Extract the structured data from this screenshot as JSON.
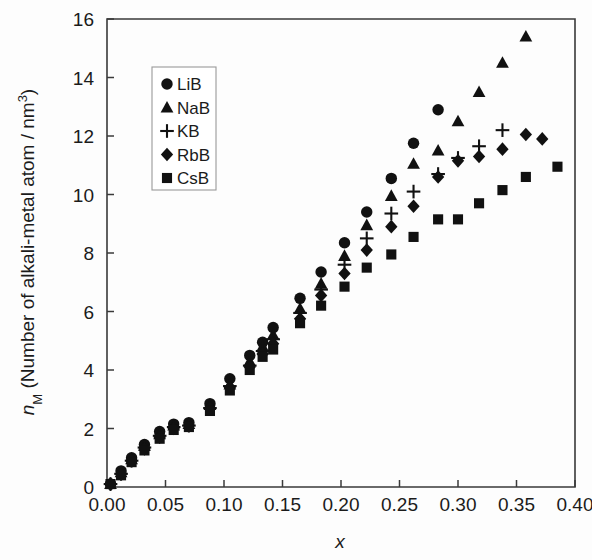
{
  "figure": {
    "name": "alkali-metal-atom-density-vs-x",
    "background": "#fdfdfd",
    "marker_color": "#111111",
    "axis_color": "#3a3a3a"
  },
  "chart_data": {
    "type": "scatter",
    "title": "",
    "subtitle": "",
    "xlabel": "x",
    "ylabel_main": "n",
    "ylabel_sub": "M",
    "ylabel_rest": " (Number of alkali-metal atom / nm",
    "ylabel_sup": "3",
    "ylabel_close": ")",
    "ylabel_plain": "nM (Number of alkali-metal atom / nm3)",
    "xlim": [
      0.0,
      0.4
    ],
    "ylim": [
      0,
      16
    ],
    "xticks": [
      0.0,
      0.05,
      0.1,
      0.15,
      0.2,
      0.25,
      0.3,
      0.35,
      0.4
    ],
    "xtick_labels": [
      "0.00",
      "0.05",
      "0.10",
      "0.15",
      "0.20",
      "0.25",
      "0.30",
      "0.35",
      "0.40"
    ],
    "yticks": [
      0,
      2,
      4,
      6,
      8,
      10,
      12,
      14,
      16
    ],
    "ytick_labels": [
      "0",
      "2",
      "4",
      "6",
      "8",
      "10",
      "12",
      "14",
      "16"
    ],
    "grid": false,
    "legend_position": "upper-left-inside",
    "series": [
      {
        "name": "LiB",
        "marker": "circle",
        "points": [
          [
            0.003,
            0.1
          ],
          [
            0.012,
            0.55
          ],
          [
            0.021,
            1.0
          ],
          [
            0.032,
            1.45
          ],
          [
            0.045,
            1.9
          ],
          [
            0.057,
            2.15
          ],
          [
            0.07,
            2.2
          ],
          [
            0.088,
            2.85
          ],
          [
            0.105,
            3.7
          ],
          [
            0.122,
            4.5
          ],
          [
            0.133,
            4.95
          ],
          [
            0.142,
            5.45
          ],
          [
            0.165,
            6.45
          ],
          [
            0.183,
            7.35
          ],
          [
            0.203,
            8.35
          ],
          [
            0.222,
            9.4
          ],
          [
            0.243,
            10.55
          ],
          [
            0.262,
            11.75
          ],
          [
            0.283,
            12.9
          ]
        ]
      },
      {
        "name": "NaB",
        "marker": "triangle",
        "points": [
          [
            0.003,
            0.1
          ],
          [
            0.012,
            0.5
          ],
          [
            0.021,
            0.95
          ],
          [
            0.032,
            1.4
          ],
          [
            0.045,
            1.8
          ],
          [
            0.057,
            2.1
          ],
          [
            0.07,
            2.15
          ],
          [
            0.088,
            2.8
          ],
          [
            0.105,
            3.5
          ],
          [
            0.122,
            4.3
          ],
          [
            0.133,
            4.8
          ],
          [
            0.142,
            5.2
          ],
          [
            0.165,
            6.1
          ],
          [
            0.183,
            6.95
          ],
          [
            0.203,
            7.9
          ],
          [
            0.222,
            8.95
          ],
          [
            0.243,
            9.95
          ],
          [
            0.262,
            11.05
          ],
          [
            0.283,
            11.5
          ],
          [
            0.3,
            12.5
          ],
          [
            0.318,
            13.5
          ],
          [
            0.338,
            14.5
          ],
          [
            0.358,
            15.4
          ]
        ]
      },
      {
        "name": "KB",
        "marker": "plus",
        "points": [
          [
            0.003,
            0.1
          ],
          [
            0.012,
            0.45
          ],
          [
            0.021,
            0.9
          ],
          [
            0.032,
            1.35
          ],
          [
            0.045,
            1.75
          ],
          [
            0.057,
            2.05
          ],
          [
            0.07,
            2.1
          ],
          [
            0.088,
            2.7
          ],
          [
            0.105,
            3.45
          ],
          [
            0.122,
            4.15
          ],
          [
            0.133,
            4.65
          ],
          [
            0.142,
            5.05
          ],
          [
            0.165,
            5.95
          ],
          [
            0.183,
            6.75
          ],
          [
            0.203,
            7.6
          ],
          [
            0.222,
            8.5
          ],
          [
            0.243,
            9.35
          ],
          [
            0.262,
            10.1
          ],
          [
            0.283,
            10.7
          ],
          [
            0.3,
            11.25
          ],
          [
            0.318,
            11.65
          ],
          [
            0.338,
            12.2
          ]
        ]
      },
      {
        "name": "RbB",
        "marker": "diamond",
        "points": [
          [
            0.003,
            0.1
          ],
          [
            0.012,
            0.45
          ],
          [
            0.021,
            0.9
          ],
          [
            0.032,
            1.3
          ],
          [
            0.045,
            1.7
          ],
          [
            0.057,
            2.0
          ],
          [
            0.07,
            2.1
          ],
          [
            0.088,
            2.7
          ],
          [
            0.105,
            3.4
          ],
          [
            0.122,
            4.1
          ],
          [
            0.133,
            4.55
          ],
          [
            0.142,
            4.9
          ],
          [
            0.165,
            5.75
          ],
          [
            0.183,
            6.55
          ],
          [
            0.203,
            7.3
          ],
          [
            0.222,
            8.1
          ],
          [
            0.243,
            8.9
          ],
          [
            0.262,
            9.6
          ],
          [
            0.283,
            10.6
          ],
          [
            0.3,
            11.15
          ],
          [
            0.318,
            11.3
          ],
          [
            0.338,
            11.55
          ],
          [
            0.358,
            12.05
          ],
          [
            0.372,
            11.9
          ]
        ]
      },
      {
        "name": "CsB",
        "marker": "square",
        "points": [
          [
            0.003,
            0.1
          ],
          [
            0.012,
            0.4
          ],
          [
            0.021,
            0.85
          ],
          [
            0.032,
            1.25
          ],
          [
            0.045,
            1.65
          ],
          [
            0.057,
            1.95
          ],
          [
            0.07,
            2.05
          ],
          [
            0.088,
            2.6
          ],
          [
            0.105,
            3.3
          ],
          [
            0.122,
            4.0
          ],
          [
            0.133,
            4.45
          ],
          [
            0.142,
            4.7
          ],
          [
            0.165,
            5.6
          ],
          [
            0.183,
            6.2
          ],
          [
            0.203,
            6.85
          ],
          [
            0.222,
            7.5
          ],
          [
            0.243,
            7.95
          ],
          [
            0.262,
            8.55
          ],
          [
            0.283,
            9.15
          ],
          [
            0.3,
            9.15
          ],
          [
            0.318,
            9.7
          ],
          [
            0.338,
            10.15
          ],
          [
            0.358,
            10.6
          ],
          [
            0.385,
            10.95
          ]
        ]
      }
    ],
    "legend": [
      {
        "label": "LiB",
        "marker": "circle"
      },
      {
        "label": "NaB",
        "marker": "triangle"
      },
      {
        "label": "KB",
        "marker": "plus"
      },
      {
        "label": "RbB",
        "marker": "diamond"
      },
      {
        "label": "CsB",
        "marker": "square"
      }
    ]
  }
}
